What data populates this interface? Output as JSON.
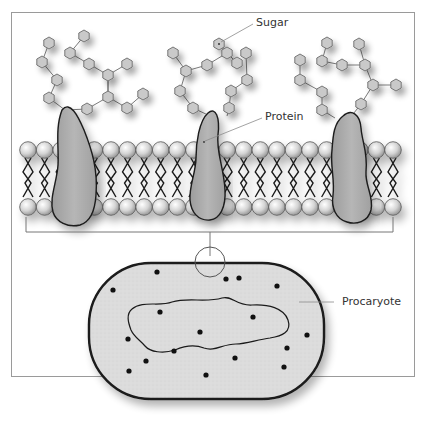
{
  "diagram": {
    "labels": {
      "sugar": "Sugar",
      "protein": "Protein",
      "procaryote": "Procaryote"
    },
    "colors": {
      "frame": "#9a9a9a",
      "hexagon_fill": "#c8c8c8",
      "hexagon_stroke": "#6a6a6a",
      "protein_fill": "#a9a9a9",
      "head_fill": "#d9d9d9",
      "cell_fill": "#dcdcdc",
      "outline": "#1a1a1a"
    },
    "components": {
      "sugar_chains": 3,
      "proteins": 3,
      "lipid_heads_per_layer": 23,
      "cell_dots": 17
    }
  }
}
